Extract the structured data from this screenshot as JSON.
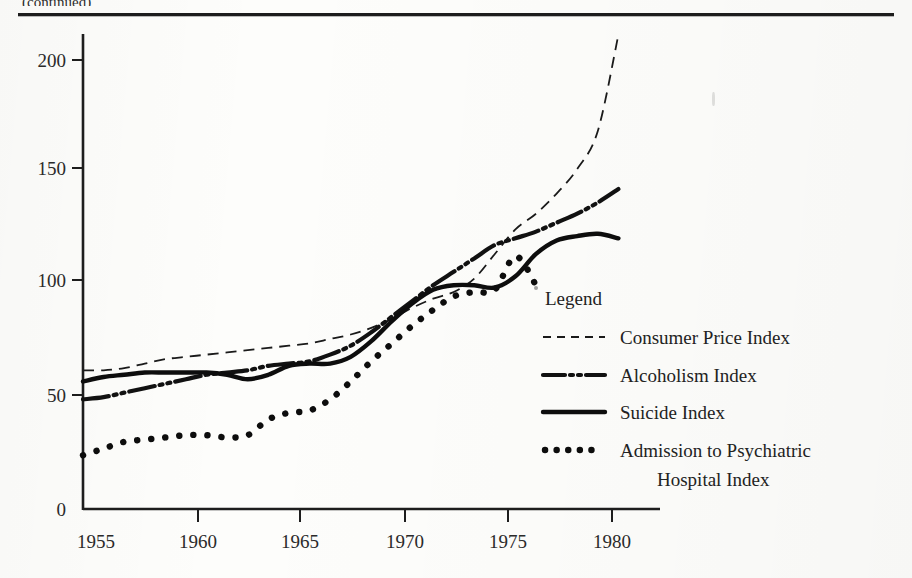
{
  "figure": {
    "top_rule": true,
    "caption_partial": "(continued)"
  },
  "chart_data": {
    "type": "line",
    "title": "",
    "xlabel": "",
    "ylabel": "",
    "xlim": [
      1954,
      1981
    ],
    "ylim": [
      0,
      215
    ],
    "yticks": [
      0,
      50,
      100,
      150,
      200
    ],
    "ytick_labels": [
      "0",
      "50",
      "100",
      "150",
      "200"
    ],
    "xticks": [
      1955,
      1960,
      1965,
      1970,
      1975,
      1980
    ],
    "xtick_labels": [
      "1955",
      "1960",
      "1965",
      "1970",
      "1975",
      "1980"
    ],
    "grid": false,
    "legend_position": "inside-lower-right",
    "legend_title": "Legend",
    "series": [
      {
        "name": "Consumer Price Index",
        "style": "dashed",
        "x": [
          1954,
          1955,
          1956,
          1957,
          1958,
          1959,
          1960,
          1961,
          1962,
          1963,
          1964,
          1965,
          1966,
          1967,
          1968,
          1969,
          1970,
          1971,
          1972,
          1973,
          1974,
          1975,
          1976,
          1977,
          1978,
          1979,
          1980
        ],
        "values": [
          62,
          62,
          63,
          65,
          67,
          68,
          69,
          70,
          71,
          72,
          73,
          74,
          76,
          78,
          81,
          85,
          90,
          94,
          97,
          103,
          114,
          125,
          132,
          141,
          152,
          169,
          212
        ]
      },
      {
        "name": "Alcoholism Index",
        "style": "dash-dot-dot",
        "x": [
          1954,
          1955,
          1956,
          1957,
          1958,
          1959,
          1960,
          1961,
          1962,
          1963,
          1964,
          1965,
          1966,
          1967,
          1968,
          1969,
          1970,
          1971,
          1972,
          1973,
          1974,
          1975,
          1976,
          1977,
          1978,
          1979,
          1980
        ],
        "values": [
          49,
          50,
          52,
          54,
          56,
          58,
          60,
          61,
          62,
          64,
          65,
          66,
          69,
          73,
          79,
          86,
          93,
          100,
          106,
          112,
          118,
          121,
          124,
          128,
          132,
          137,
          143
        ]
      },
      {
        "name": "Suicide Index",
        "style": "solid",
        "x": [
          1954,
          1955,
          1956,
          1957,
          1958,
          1959,
          1960,
          1961,
          1962,
          1963,
          1964,
          1965,
          1966,
          1967,
          1968,
          1969,
          1970,
          1971,
          1972,
          1973,
          1974,
          1975,
          1976,
          1977,
          1978,
          1979,
          1980
        ],
        "values": [
          57,
          59,
          60,
          61,
          61,
          61,
          61,
          60,
          58,
          60,
          64,
          65,
          65,
          68,
          75,
          84,
          92,
          98,
          100,
          100,
          99,
          104,
          114,
          120,
          122,
          123,
          121
        ]
      },
      {
        "name": "Admission to Psychiatric Hospital Index",
        "style": "dotted",
        "x": [
          1954,
          1955,
          1956,
          1957,
          1958,
          1959,
          1960,
          1961,
          1962,
          1963,
          1964,
          1965,
          1966,
          1967,
          1968,
          1969,
          1970,
          1971,
          1972,
          1973,
          1974,
          1975,
          1976
        ],
        "values": [
          24,
          27,
          30,
          31,
          32,
          33,
          33,
          32,
          33,
          40,
          43,
          44,
          49,
          57,
          66,
          74,
          82,
          89,
          95,
          97,
          98,
          113,
          100
        ]
      }
    ]
  },
  "legend": {
    "title": "Legend",
    "entries": [
      {
        "label": "Consumer Price Index",
        "style": "dashed"
      },
      {
        "label": "Alcoholism Index",
        "style": "dash-dot-dot"
      },
      {
        "label": "Suicide Index",
        "style": "solid"
      },
      {
        "label": "Admission to Psychiatric",
        "label2": "Hospital Index",
        "style": "dotted"
      }
    ]
  },
  "colors": {
    "ink": "#1a1a1a",
    "paper": "#fdfdfb",
    "axis": "#1d1d1d"
  }
}
